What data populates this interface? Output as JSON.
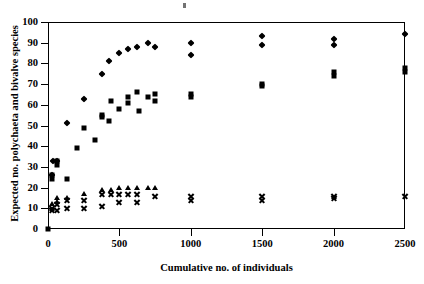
{
  "chart_data": {
    "type": "scatter",
    "title": "",
    "xlabel": "Cumulative no. of individuals",
    "ylabel": "Expected no. polychaeta and bivalve species",
    "xlim": [
      0,
      2500
    ],
    "ylim": [
      0,
      100
    ],
    "xticks": [
      0,
      500,
      1000,
      1500,
      2000,
      2500
    ],
    "yticks": [
      0,
      10,
      20,
      30,
      40,
      50,
      60,
      70,
      80,
      90,
      100
    ],
    "grid": false,
    "legend": "none",
    "series": [
      {
        "name": "diamond",
        "marker": "diamond",
        "color": "#000000",
        "points": [
          [
            30,
            26
          ],
          [
            35,
            33
          ],
          [
            60,
            33
          ],
          [
            130,
            51
          ],
          [
            250,
            63
          ],
          [
            380,
            75
          ],
          [
            430,
            81
          ],
          [
            500,
            85
          ],
          [
            560,
            87
          ],
          [
            620,
            88
          ],
          [
            700,
            90
          ],
          [
            750,
            88
          ],
          [
            1000,
            90
          ],
          [
            1000,
            84
          ],
          [
            1500,
            93
          ],
          [
            1500,
            89
          ],
          [
            2000,
            92
          ],
          [
            2000,
            89
          ],
          [
            2500,
            94
          ]
        ]
      },
      {
        "name": "square",
        "marker": "square",
        "color": "#000000",
        "points": [
          [
            25,
            24
          ],
          [
            25,
            26
          ],
          [
            60,
            31
          ],
          [
            60,
            33
          ],
          [
            130,
            24
          ],
          [
            200,
            39
          ],
          [
            250,
            49
          ],
          [
            330,
            43
          ],
          [
            380,
            55
          ],
          [
            380,
            54
          ],
          [
            430,
            52
          ],
          [
            440,
            62
          ],
          [
            500,
            58
          ],
          [
            560,
            64
          ],
          [
            560,
            61
          ],
          [
            620,
            66
          ],
          [
            640,
            57
          ],
          [
            700,
            64
          ],
          [
            750,
            65
          ],
          [
            750,
            62
          ],
          [
            1000,
            65
          ],
          [
            1000,
            64
          ],
          [
            1500,
            70
          ],
          [
            1500,
            69
          ],
          [
            2000,
            76
          ],
          [
            2000,
            74
          ],
          [
            2500,
            78
          ],
          [
            2500,
            76
          ]
        ]
      },
      {
        "name": "triangle",
        "marker": "triangle",
        "color": "#000000",
        "points": [
          [
            30,
            12
          ],
          [
            60,
            13
          ],
          [
            60,
            15
          ],
          [
            130,
            15
          ],
          [
            250,
            17
          ],
          [
            380,
            19
          ],
          [
            440,
            19
          ],
          [
            500,
            20
          ],
          [
            560,
            20
          ],
          [
            620,
            20
          ],
          [
            700,
            20
          ],
          [
            750,
            20
          ]
        ]
      },
      {
        "name": "cross",
        "marker": "cross",
        "color": "#000000",
        "points": [
          [
            25,
            9
          ],
          [
            30,
            10
          ],
          [
            60,
            9
          ],
          [
            60,
            12
          ],
          [
            130,
            10
          ],
          [
            130,
            14
          ],
          [
            250,
            10
          ],
          [
            250,
            14
          ],
          [
            380,
            11
          ],
          [
            380,
            17
          ],
          [
            440,
            17
          ],
          [
            500,
            13
          ],
          [
            500,
            17
          ],
          [
            560,
            17
          ],
          [
            620,
            13
          ],
          [
            620,
            17
          ],
          [
            750,
            16
          ],
          [
            1000,
            16
          ],
          [
            1000,
            14
          ],
          [
            1500,
            16
          ],
          [
            1500,
            14
          ],
          [
            2000,
            16
          ],
          [
            2000,
            15
          ],
          [
            2500,
            16
          ]
        ]
      }
    ]
  },
  "axes": {
    "y_tick_labels": [
      "0",
      "10",
      "20",
      "30",
      "40",
      "50",
      "60",
      "70",
      "80",
      "90",
      "100"
    ],
    "x_tick_labels": [
      "0",
      "500",
      "1000",
      "1500",
      "2000",
      "2500"
    ],
    "y_title": "Expected no. polychaeta and bivalve species",
    "x_title": "Cumulative no. of individuals"
  }
}
